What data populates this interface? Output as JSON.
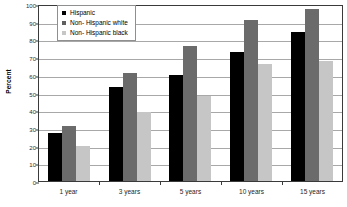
{
  "chart_data": {
    "type": "bar",
    "title": "",
    "xlabel": "",
    "ylabel": "Percent",
    "ylim": [
      0,
      100
    ],
    "ytick_step": 10,
    "grid": true,
    "legend_position": "top-left-inside",
    "categories": [
      "1 year",
      "3 years",
      "5 years",
      "10 years",
      "15 years"
    ],
    "yticks": [
      "0",
      "10",
      "20",
      "30",
      "40",
      "50",
      "60",
      "70",
      "80",
      "90",
      "100"
    ],
    "series": [
      {
        "name": "Hispanic",
        "color": "#000000",
        "values": [
          27,
          53,
          60,
          73,
          84
        ]
      },
      {
        "name": "Non- Hispanic white",
        "color": "#6b6b6b",
        "values": [
          31,
          61,
          76,
          91,
          97
        ]
      },
      {
        "name": "Non- Hispanic black",
        "color": "#c6c6c6",
        "values": [
          20,
          39,
          48,
          66,
          68
        ]
      }
    ]
  },
  "legend": {
    "items": [
      {
        "label": "Hispanic",
        "swatch": "legend-swatch-hispanic"
      },
      {
        "label": "Non- Hispanic white",
        "swatch": "legend-swatch-non-hispanic-white"
      },
      {
        "label": "Non- Hispanic black",
        "swatch": "legend-swatch-non-hispanic-black"
      }
    ]
  }
}
